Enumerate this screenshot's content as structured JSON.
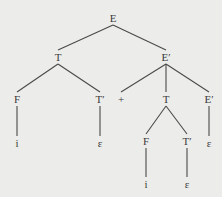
{
  "diagram": {
    "type": "parse-tree",
    "nodes": [
      {
        "id": "n0",
        "label": "E",
        "x": 113,
        "y": 18
      },
      {
        "id": "n1",
        "label": "T",
        "x": 58,
        "y": 57
      },
      {
        "id": "n2",
        "label": "E′",
        "x": 166,
        "y": 57
      },
      {
        "id": "n3",
        "label": "F",
        "x": 17,
        "y": 99
      },
      {
        "id": "n4",
        "label": "T′",
        "x": 100,
        "y": 99
      },
      {
        "id": "n5",
        "label": "+",
        "x": 121,
        "y": 99
      },
      {
        "id": "n6",
        "label": "T",
        "x": 166,
        "y": 99
      },
      {
        "id": "n7",
        "label": "E′",
        "x": 209,
        "y": 99
      },
      {
        "id": "n8",
        "label": "i",
        "x": 17,
        "y": 143
      },
      {
        "id": "n9",
        "label": "ε",
        "x": 100,
        "y": 143
      },
      {
        "id": "n10",
        "label": "F",
        "x": 146,
        "y": 141
      },
      {
        "id": "n11",
        "label": "T′",
        "x": 187,
        "y": 141
      },
      {
        "id": "n12",
        "label": "ε",
        "x": 209,
        "y": 143
      },
      {
        "id": "n13",
        "label": "i",
        "x": 146,
        "y": 184
      },
      {
        "id": "n14",
        "label": "ε",
        "x": 187,
        "y": 184
      }
    ],
    "edges": [
      [
        "n0",
        "n1"
      ],
      [
        "n0",
        "n2"
      ],
      [
        "n1",
        "n3"
      ],
      [
        "n1",
        "n4"
      ],
      [
        "n2",
        "n5"
      ],
      [
        "n2",
        "n6"
      ],
      [
        "n2",
        "n7"
      ],
      [
        "n3",
        "n8"
      ],
      [
        "n4",
        "n9"
      ],
      [
        "n6",
        "n10"
      ],
      [
        "n6",
        "n11"
      ],
      [
        "n7",
        "n12"
      ],
      [
        "n10",
        "n13"
      ],
      [
        "n11",
        "n14"
      ]
    ]
  }
}
